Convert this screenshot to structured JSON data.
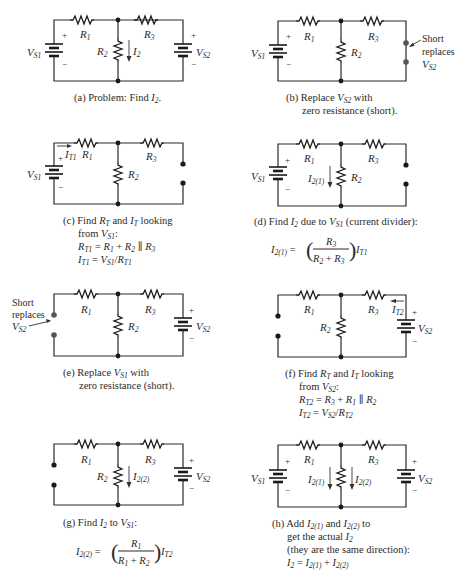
{
  "panels": {
    "a": {
      "caption": "(a) Problem: Find I2.",
      "caption_parts": {
        "prefix": "(a) Problem: Find ",
        "var": "I",
        "sub": "2",
        "suffix": "."
      },
      "components": [
        "VS1",
        "R1",
        "R2",
        "R3",
        "VS2"
      ],
      "current_label": "I2"
    },
    "b": {
      "caption_line1": "(b) Replace VS2 with",
      "caption_line2": "zero resistance (short).",
      "components": [
        "VS1",
        "R1",
        "R2",
        "R3"
      ],
      "note_lines": [
        "Short",
        "replaces",
        "VS2"
      ]
    },
    "c": {
      "caption_lines": [
        "(c) Find RT and IT looking",
        "from VS1:",
        "RT1 = R1 + R2 || R3",
        "IT1 = VS1/RT1"
      ],
      "components": [
        "VS1",
        "R1",
        "R2",
        "R3"
      ],
      "current_label": "IT1"
    },
    "d": {
      "caption_line1": "(d) Find I2 due to VS1 (current divider):",
      "equation": "I2(1) = (R3 / (R2 + R3)) IT1",
      "components": [
        "VS1",
        "R1",
        "R2",
        "R3"
      ],
      "current_label": "I2(1)"
    },
    "e": {
      "caption_line1": "(e) Replace VS1 with",
      "caption_line2": "zero resistance (short).",
      "components": [
        "R1",
        "R2",
        "R3",
        "VS2"
      ],
      "note_lines": [
        "Short",
        "replaces",
        "VS2"
      ]
    },
    "f": {
      "caption_lines": [
        "(f) Find RT and IT looking",
        "from VS2:",
        "RT2 = R3 + R1 || R2",
        "IT2 = VS2/RT2"
      ],
      "components": [
        "R1",
        "R2",
        "R3",
        "VS2"
      ],
      "current_label": "IT2"
    },
    "g": {
      "caption_line1": "(g) Find I2 to VS1:",
      "equation": "I2(2) = (R1 / (R1 + R2)) IT2",
      "components": [
        "R1",
        "R2",
        "R3",
        "VS2"
      ],
      "current_label": "I2(2)"
    },
    "h": {
      "caption_lines": [
        "(h) Add I2(1) and I2(2) to",
        "get the actual I2",
        "(they are the same direction):",
        "I2 = I2(1) + I2(2)"
      ],
      "components": [
        "VS1",
        "R1",
        "R2",
        "R3",
        "VS2"
      ],
      "current_labels": [
        "I2(1)",
        "I2(2)"
      ]
    }
  },
  "text": {
    "V": "V",
    "R": "R",
    "I": "I",
    "s1": "S1",
    "s2": "S2",
    "one": "1",
    "two": "2",
    "three": "3",
    "t1": "T1",
    "t2": "T2",
    "T": "T",
    "two1": "2(1)",
    "two2": "2(2)",
    "plus": "+",
    "minus": "−",
    "short": "Short",
    "replaces": "replaces",
    "a_prefix": "(a) Problem: Find ",
    "b_l1_pre": "(b) Replace  ",
    "b_l1_post": " with",
    "b_l2": "zero resistance (short).",
    "c_l1_pre": "(c) Find ",
    "and": " and ",
    "looking": " looking",
    "from": "from ",
    "colon": ":",
    "eq": " = ",
    "plus_op": " + ",
    "par": " ∥ ",
    "slash": "/",
    "d_l1_pre": "(d) Find ",
    "due_to": " due to ",
    "d_l1_post": " (current divider):",
    "e_l1_pre": "(e) Replace  ",
    "f_l1_pre": "(f) Find ",
    "g_l1_pre": "(g) Find ",
    "to": " to ",
    "h_l1_pre": "(h) Add ",
    "h_to": " to",
    "h_l2": "get the actual ",
    "h_l3": "(they are the same direction):",
    "period": "."
  }
}
